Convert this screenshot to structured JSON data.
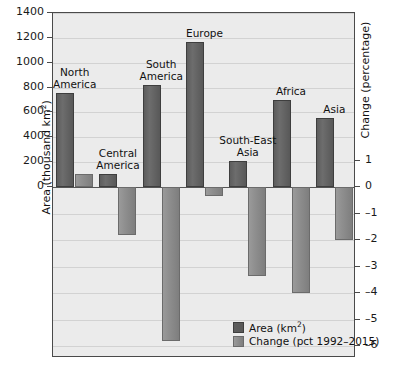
{
  "chart_data": {
    "type": "bar",
    "title": "",
    "categories": [
      "North America",
      "Central America",
      "South America",
      "Europe",
      "South-East Asia",
      "Africa",
      "Asia"
    ],
    "series": [
      {
        "name": "Area (km2)",
        "values": [
          753,
          105,
          818,
          1165,
          210,
          704,
          558
        ]
      },
      {
        "name": "Change (pct 1992-2015)",
        "values": [
          0.5,
          -1.8,
          -5.8,
          -0.35,
          -3.35,
          -4.0,
          -2.0
        ]
      }
    ],
    "ylabel": "Area (thousand km²)",
    "ylabel_right": "Change (percentage)",
    "xlabel": "",
    "ylim": [
      0,
      1400
    ],
    "ylim_right": [
      -7,
      1.4
    ],
    "yticks": [
      0,
      200,
      400,
      600,
      800,
      1000,
      1200,
      1400
    ],
    "yticks_right": [
      1,
      0,
      -1,
      -2,
      -3,
      -4,
      -5,
      -6,
      -7
    ],
    "grid": true,
    "legend_position": "bottom-right"
  },
  "axes": {
    "left_title": "Area (thousand km",
    "left_title_sup": "2",
    "left_title_end": ")",
    "right_title": "Change (percentage)",
    "left_ticks": [
      "1400",
      "1200",
      "1000",
      "800",
      "600",
      "400",
      "200",
      "0"
    ],
    "right_ticks": [
      "1",
      "0",
      "–1",
      "–2",
      "–3",
      "–4",
      "–5",
      "–6",
      "–7"
    ]
  },
  "category_labels": [
    {
      "line1": "North",
      "line2": "America"
    },
    {
      "line1": "Central",
      "line2": "America"
    },
    {
      "line1": "South",
      "line2": "America"
    },
    {
      "line1": "Europe",
      "line2": ""
    },
    {
      "line1": "South-East",
      "line2": "Asia"
    },
    {
      "line1": "Africa",
      "line2": ""
    },
    {
      "line1": "Asia",
      "line2": ""
    }
  ],
  "legend": {
    "area_label_pre": "Area (km",
    "area_label_sup": "2",
    "area_label_post": ")",
    "change_label": "Change (pct 1992–2015)"
  },
  "colors": {
    "plot_background": "#ebebeb",
    "frame": "#4a4a4a",
    "grid": "#d2d2d2",
    "area_bar": "#5d5d5d",
    "change_bar": "#8e8e8e",
    "text": "#111111"
  }
}
